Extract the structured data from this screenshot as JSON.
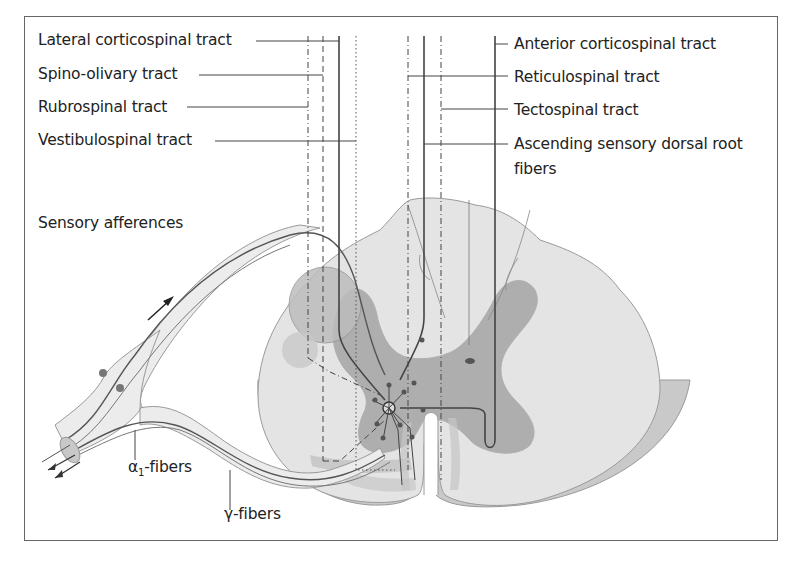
{
  "diagram": {
    "type": "anatomical illustration"
  },
  "labels_left": [
    {
      "id": "lateral-corticospinal",
      "text": "Lateral corticospinal tract"
    },
    {
      "id": "spino-olivary",
      "text": "Spino-olivary tract"
    },
    {
      "id": "rubrospinal",
      "text": "Rubrospinal tract"
    },
    {
      "id": "vestibulospinal",
      "text": "Vestibulospinal tract"
    }
  ],
  "labels_right": [
    {
      "id": "anterior-corticospinal",
      "text": "Anterior corticospinal tract"
    },
    {
      "id": "reticulospinal",
      "text": "Reticulospinal tract"
    },
    {
      "id": "tectospinal",
      "text": "Tectospinal tract"
    },
    {
      "id": "ascending-sensory-1",
      "text": "Ascending sensory dorsal root"
    },
    {
      "id": "ascending-sensory-2",
      "text": "fibers"
    }
  ],
  "labels_other": {
    "sensory_afferences": "Sensory afferences",
    "alpha_prefix": "α",
    "alpha_sub": "1",
    "alpha_suffix": "-fibers",
    "gamma_fibers": "γ-fibers"
  },
  "colors": {
    "white_matter": "#e6e6e6",
    "gray_matter": "#a8a8a8",
    "tract_region": "#c6c6c6",
    "nerve_fill": "#ececec",
    "line": "#444444",
    "edge": "#bdbdbd"
  }
}
